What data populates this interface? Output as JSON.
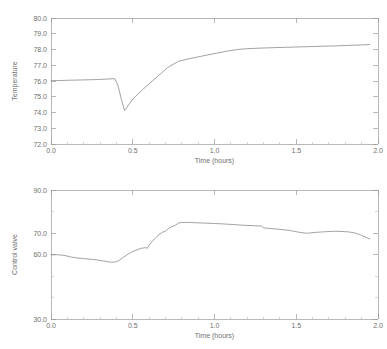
{
  "cut_title_fragment": "..",
  "charts": [
    {
      "name": "temperature-chart",
      "type": "line",
      "title": "",
      "xlabel": "Time (hours)",
      "ylabel": "Temperature",
      "xlim": [
        0.0,
        2.0
      ],
      "ylim": [
        72.0,
        80.0
      ],
      "xticks": [
        0.0,
        0.5,
        1.0,
        1.5,
        2.0
      ],
      "xtick_labels": [
        "0.0",
        "0.5",
        "1.0",
        "1.5",
        "2.0"
      ],
      "yticks": [
        72.0,
        73.0,
        74.0,
        75.0,
        76.0,
        77.0,
        78.0,
        79.0,
        80.0
      ],
      "ytick_labels": [
        "72.0",
        "73.0",
        "74.0",
        "75.0",
        "76.0",
        "77.0",
        "78.0",
        "79.0",
        "80.0"
      ],
      "grid": false,
      "legend": "none",
      "series": [
        {
          "name": "Temperature",
          "color": "#8c8c8c",
          "x": [
            0.0,
            0.05,
            0.12,
            0.2,
            0.28,
            0.34,
            0.39,
            0.41,
            0.43,
            0.45,
            0.5,
            0.56,
            0.62,
            0.68,
            0.72,
            0.78,
            0.84,
            0.9,
            0.96,
            1.02,
            1.08,
            1.14,
            1.2,
            1.26,
            1.34,
            1.44,
            1.54,
            1.64,
            1.74,
            1.84,
            1.9,
            1.95
          ],
          "y": [
            76.02,
            76.03,
            76.05,
            76.07,
            76.09,
            76.12,
            76.15,
            75.7,
            74.85,
            74.12,
            74.85,
            75.45,
            76.0,
            76.55,
            76.9,
            77.25,
            77.4,
            77.53,
            77.66,
            77.78,
            77.9,
            78.0,
            78.05,
            78.08,
            78.11,
            78.14,
            78.17,
            78.2,
            78.23,
            78.27,
            78.29,
            78.31
          ]
        }
      ]
    },
    {
      "name": "control-valve-chart",
      "type": "line",
      "title": "",
      "xlabel": "Time (hours)",
      "ylabel": "Control valve",
      "xlim": [
        0.0,
        2.0
      ],
      "ylim": [
        30.0,
        90.0
      ],
      "xticks": [
        0.0,
        0.5,
        1.0,
        1.5,
        2.0
      ],
      "xtick_labels": [
        "0.0",
        "0.5",
        "1.0",
        "1.5",
        "2.0"
      ],
      "yticks": [
        30.0,
        40.0,
        50.0,
        60.0,
        70.0,
        80.0,
        90.0
      ],
      "ytick_labels": [
        "30.0",
        "",
        "",
        "60.0",
        "70.0",
        "",
        "90.0"
      ],
      "grid": false,
      "legend": "none",
      "series": [
        {
          "name": "Control valve",
          "color": "#8c8c8c",
          "x": [
            0.0,
            0.04,
            0.08,
            0.12,
            0.16,
            0.2,
            0.24,
            0.28,
            0.32,
            0.35,
            0.37,
            0.4,
            0.42,
            0.44,
            0.46,
            0.48,
            0.5,
            0.52,
            0.54,
            0.56,
            0.58,
            0.59,
            0.6,
            0.62,
            0.64,
            0.66,
            0.68,
            0.7,
            0.72,
            0.74,
            0.76,
            0.78,
            0.8,
            0.84,
            0.88,
            0.94,
            1.0,
            1.06,
            1.12,
            1.18,
            1.24,
            1.29,
            1.3,
            1.34,
            1.4,
            1.46,
            1.52,
            1.56,
            1.58,
            1.62,
            1.66,
            1.7,
            1.74,
            1.78,
            1.82,
            1.86,
            1.9,
            1.95
          ],
          "y": [
            59.9,
            59.9,
            59.6,
            58.9,
            58.4,
            58.1,
            57.8,
            57.5,
            57.0,
            56.6,
            56.4,
            56.6,
            57.4,
            58.6,
            59.6,
            60.6,
            61.4,
            62.0,
            62.6,
            63.0,
            63.2,
            62.9,
            64.4,
            66.2,
            67.8,
            69.2,
            70.3,
            70.9,
            72.1,
            73.0,
            73.6,
            74.6,
            74.9,
            74.9,
            74.8,
            74.6,
            74.4,
            74.2,
            73.9,
            73.6,
            73.4,
            73.2,
            72.4,
            72.1,
            71.7,
            71.2,
            70.3,
            69.9,
            70.0,
            70.3,
            70.5,
            70.7,
            70.8,
            70.7,
            70.5,
            70.0,
            68.9,
            67.2
          ]
        }
      ]
    }
  ]
}
